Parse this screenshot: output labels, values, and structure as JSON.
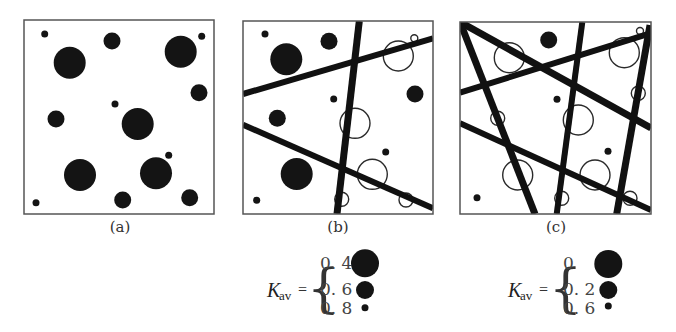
{
  "figure": {
    "panels": [
      {
        "id": "a",
        "label": "(a)",
        "box": {
          "x": 24,
          "y": 20,
          "w": 190,
          "h": 194
        },
        "filled_particles": [
          {
            "cx": 44.7,
            "cy": 34,
            "r": 3.5
          },
          {
            "cx": 112,
            "cy": 41,
            "r": 8.5
          },
          {
            "cx": 69.7,
            "cy": 62.7,
            "r": 16
          },
          {
            "cx": 180.7,
            "cy": 51.7,
            "r": 16
          },
          {
            "cx": 201.7,
            "cy": 36.3,
            "r": 3.5
          },
          {
            "cx": 199,
            "cy": 92.7,
            "r": 8.5
          },
          {
            "cx": 115,
            "cy": 104,
            "r": 3.5
          },
          {
            "cx": 56,
            "cy": 119,
            "r": 8.5
          },
          {
            "cx": 137.7,
            "cy": 124,
            "r": 16
          },
          {
            "cx": 80,
            "cy": 175,
            "r": 16
          },
          {
            "cx": 156,
            "cy": 173.3,
            "r": 16
          },
          {
            "cx": 168.7,
            "cy": 155.3,
            "r": 3.5
          },
          {
            "cx": 36,
            "cy": 202.7,
            "r": 3.5
          },
          {
            "cx": 122.7,
            "cy": 200,
            "r": 8.5
          },
          {
            "cx": 189.7,
            "cy": 197.7,
            "r": 8.5
          }
        ],
        "open_particles": [],
        "cracks": []
      },
      {
        "id": "b",
        "label": "(b)",
        "box": {
          "x": 243,
          "y": 21,
          "w": 190,
          "h": 193
        },
        "filled_particles": [
          {
            "cx": 265,
            "cy": 34,
            "r": 3.5
          },
          {
            "cx": 286.3,
            "cy": 59.3,
            "r": 16
          },
          {
            "cx": 329,
            "cy": 41.3,
            "r": 8.5
          },
          {
            "cx": 415,
            "cy": 94,
            "r": 8.5
          },
          {
            "cx": 333.7,
            "cy": 99,
            "r": 3.5
          },
          {
            "cx": 277.3,
            "cy": 118.3,
            "r": 8.5
          },
          {
            "cx": 385.7,
            "cy": 152,
            "r": 3.5
          },
          {
            "cx": 296.7,
            "cy": 174,
            "r": 16
          },
          {
            "cx": 256.7,
            "cy": 200.3,
            "r": 3.5
          }
        ],
        "open_particles": [
          {
            "cx": 398.3,
            "cy": 56,
            "r": 15
          },
          {
            "cx": 414.3,
            "cy": 38.3,
            "r": 3.5
          },
          {
            "cx": 355,
            "cy": 123.3,
            "r": 15
          },
          {
            "cx": 372.3,
            "cy": 174.3,
            "r": 15
          },
          {
            "cx": 341.7,
            "cy": 199.3,
            "r": 7
          },
          {
            "cx": 406,
            "cy": 200,
            "r": 7
          }
        ],
        "cracks": [
          {
            "x1": 243,
            "y1": 94,
            "x2": 433,
            "y2": 38.3,
            "w": 6
          },
          {
            "x1": 359.3,
            "y1": 21,
            "x2": 337,
            "y2": 214,
            "w": 7
          },
          {
            "x1": 243,
            "y1": 124.7,
            "x2": 433,
            "y2": 208.3,
            "w": 6
          }
        ]
      },
      {
        "id": "c",
        "label": "(c)",
        "box": {
          "x": 460,
          "y": 22,
          "w": 191,
          "h": 192
        },
        "filled_particles": [
          {
            "cx": 548.7,
            "cy": 40,
            "r": 8.5
          },
          {
            "cx": 557,
            "cy": 99.3,
            "r": 3.5
          },
          {
            "cx": 608,
            "cy": 151.3,
            "r": 3.5
          },
          {
            "cx": 477,
            "cy": 197.7,
            "r": 3.5
          }
        ],
        "open_particles": [
          {
            "cx": 509.3,
            "cy": 57.7,
            "r": 15
          },
          {
            "cx": 624.3,
            "cy": 52.7,
            "r": 15
          },
          {
            "cx": 640,
            "cy": 31,
            "r": 3.5
          },
          {
            "cx": 638.3,
            "cy": 93.3,
            "r": 7
          },
          {
            "cx": 497.7,
            "cy": 118.3,
            "r": 7
          },
          {
            "cx": 578.3,
            "cy": 120,
            "r": 15
          },
          {
            "cx": 517.7,
            "cy": 175,
            "r": 15
          },
          {
            "cx": 595,
            "cy": 175,
            "r": 15
          },
          {
            "cx": 561.7,
            "cy": 198.3,
            "r": 7
          },
          {
            "cx": 630,
            "cy": 198.3,
            "r": 7
          }
        ],
        "cracks": [
          {
            "x1": 460,
            "y1": 22,
            "x2": 651,
            "y2": 128,
            "w": 7
          },
          {
            "x1": 460,
            "y1": 22,
            "x2": 535,
            "y2": 214,
            "w": 7
          },
          {
            "x1": 460,
            "y1": 92.7,
            "x2": 651,
            "y2": 33,
            "w": 6
          },
          {
            "x1": 582.3,
            "y1": 22,
            "x2": 556.7,
            "y2": 214,
            "w": 6
          },
          {
            "x1": 650,
            "y1": 25,
            "x2": 616.7,
            "y2": 214,
            "w": 7
          },
          {
            "x1": 460,
            "y1": 123.3,
            "x2": 651,
            "y2": 210,
            "w": 6
          }
        ]
      }
    ],
    "legends": [
      {
        "for_panel": "b",
        "symbol": "K",
        "subscript": "av",
        "equals": "=",
        "brace": "{",
        "entries": [
          {
            "value": "0. 4",
            "circle_r": 14,
            "cy": 263.3
          },
          {
            "value": "0. 6",
            "circle_r": 9,
            "cy": 290
          },
          {
            "value": "0. 8",
            "circle_r": 3.5,
            "cy": 307.7
          }
        ]
      },
      {
        "for_panel": "c",
        "symbol": "K",
        "subscript": "av",
        "equals": "=",
        "brace": "{",
        "entries": [
          {
            "value": "0",
            "circle_r": 14,
            "cy": 264
          },
          {
            "value": "0. 2",
            "circle_r": 9,
            "cy": 290
          },
          {
            "value": "0. 6",
            "circle_r": 3.5,
            "cy": 306
          }
        ]
      }
    ]
  }
}
